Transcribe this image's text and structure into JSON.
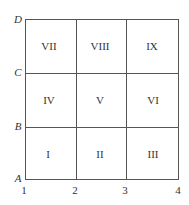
{
  "diagram": {
    "type": "3x3 grid",
    "y_labels": [
      "A",
      "B",
      "C",
      "D"
    ],
    "x_labels": [
      "1",
      "2",
      "3",
      "4"
    ],
    "cells": [
      {
        "label": "VII",
        "row": 0,
        "col": 0
      },
      {
        "label": "VIII",
        "row": 0,
        "col": 1
      },
      {
        "label": "IX",
        "row": 0,
        "col": 2
      },
      {
        "label": "IV",
        "row": 1,
        "col": 0
      },
      {
        "label": "V",
        "row": 1,
        "col": 1
      },
      {
        "label": "VI",
        "row": 1,
        "col": 2
      },
      {
        "label": "I",
        "row": 2,
        "col": 0
      },
      {
        "label": "II",
        "row": 2,
        "col": 1
      },
      {
        "label": "III",
        "row": 2,
        "col": 2
      }
    ]
  }
}
